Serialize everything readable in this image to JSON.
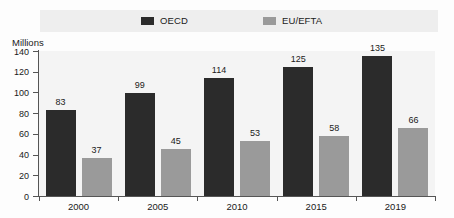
{
  "chart_data": {
    "type": "bar",
    "title": "",
    "subtitle": "",
    "xlabel": "",
    "ylabel": "Millions",
    "ylim": [
      0,
      140
    ],
    "ytick_values": [
      0,
      20,
      40,
      60,
      80,
      100,
      120,
      140
    ],
    "ytick_labels": [
      "0",
      "20",
      "40",
      "60",
      "80",
      "100",
      "120",
      "140"
    ],
    "grid": false,
    "legend_position": "top",
    "categories": [
      "2000",
      "2005",
      "2010",
      "2015",
      "2019"
    ],
    "series": [
      {
        "name": "OECD",
        "color": "#2b2b2b",
        "values": [
          83,
          99,
          114,
          125,
          135
        ],
        "labels": [
          "83",
          "99",
          "114",
          "125",
          "135"
        ]
      },
      {
        "name": "EU/EFTA",
        "color": "#9a9a9a",
        "values": [
          37,
          45,
          53,
          58,
          66
        ],
        "labels": [
          "37",
          "45",
          "53",
          "58",
          "66"
        ]
      }
    ]
  },
  "legend": {
    "items": [
      {
        "label": "OECD",
        "color": "#2b2b2b"
      },
      {
        "label": "EU/EFTA",
        "color": "#9a9a9a"
      }
    ],
    "band_color": "#eeeeee"
  },
  "axis": {
    "y_title": "Millions",
    "line_color": "#555555"
  },
  "plot": {
    "background": "#f4f4f4"
  }
}
